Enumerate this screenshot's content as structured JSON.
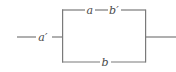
{
  "figure": {
    "type": "parallel-branch-network-diagram",
    "background_color": "#ffffff",
    "line_color": "#7a7a7a",
    "label_color": "#4a4a4a",
    "line_width": 1.2,
    "width": 176,
    "height": 72
  },
  "labels": {
    "input": "a′",
    "top_left": "a",
    "top_right": "b′",
    "bottom": "b"
  },
  "label_positions": {
    "input": {
      "x": 43,
      "y": 37
    },
    "top_left": {
      "x": 90,
      "y": 10
    },
    "top_right": {
      "x": 114,
      "y": 10
    },
    "bottom": {
      "x": 105,
      "y": 62
    }
  },
  "geometry": {
    "left_node_x": 62,
    "right_node_x": 145,
    "top_branch_y": 10,
    "bottom_branch_y": 62,
    "mid_y": 37,
    "input_line": {
      "x1": 17,
      "x2": 62,
      "y": 37
    },
    "output_line": {
      "x1": 145,
      "x2": 176,
      "y": 37
    },
    "top_branch": {
      "x1": 62,
      "x2": 145,
      "y": 10
    },
    "bottom_branch": {
      "x1": 62,
      "x2": 145,
      "y": 62
    },
    "left_vertical": {
      "x": 62,
      "y1": 10,
      "y2": 62
    },
    "right_vertical": {
      "x": 145,
      "y1": 10,
      "y2": 62
    }
  },
  "label_gaps": {
    "input": {
      "start": 36,
      "end": 52
    },
    "top_left": {
      "start": 85,
      "end": 95
    },
    "top_right": {
      "start": 108,
      "end": 121
    },
    "bottom": {
      "start": 100,
      "end": 111
    }
  }
}
